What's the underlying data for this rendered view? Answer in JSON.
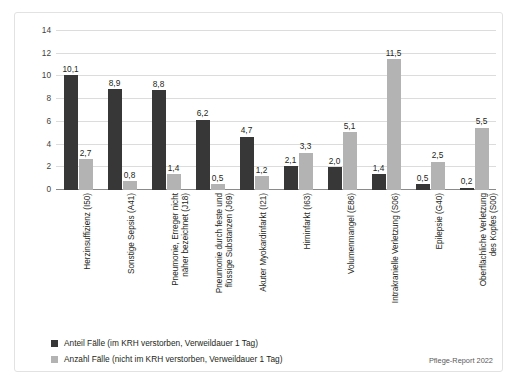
{
  "chart_data": {
    "type": "bar",
    "title": "",
    "xlabel": "",
    "ylabel": "",
    "ylim": [
      0,
      14
    ],
    "yticks": [
      0,
      2,
      4,
      6,
      8,
      10,
      12,
      14
    ],
    "grid": true,
    "legend_position": "bottom-left",
    "categories": [
      "Herzinsuffizienz (I50)",
      "Sonstige Sepsis (A41)",
      "Pneumonie, Erreger nicht\nnäher bezeichnet (J18)",
      "Pneumonie durch feste und\nflüssige Substanzen (J69)",
      "Akuter Myokardinfarkt (I21)",
      "Hirninfarkt (I63)",
      "Volumenmangel (E86)",
      "Intrakranielle Verletzung (S06)",
      "Epilepsie (G40)",
      "Oberflächliche Verletzung\ndes Kopfes (S00)"
    ],
    "series": [
      {
        "name": "Anteil Fälle (im KRH verstorben, Verweildauer 1 Tag)",
        "color": "#373737",
        "values": [
          10.1,
          8.9,
          8.8,
          6.2,
          4.7,
          2.1,
          2.0,
          1.4,
          0.5,
          0.2
        ],
        "labels": [
          "10,1",
          "8,9",
          "8,8",
          "6,2",
          "4,7",
          "2,1",
          "2,0",
          "1,4",
          "0,5",
          "0,2"
        ]
      },
      {
        "name": "Anzahl Fälle (nicht im KRH verstorben, Verweildauer 1 Tag)",
        "color": "#b3b3b3",
        "values": [
          2.7,
          0.8,
          1.4,
          0.5,
          1.2,
          3.3,
          5.1,
          11.5,
          2.5,
          5.5
        ],
        "labels": [
          "2,7",
          "0,8",
          "1,4",
          "0,5",
          "1,2",
          "3,3",
          "5,1",
          "11,5",
          "2,5",
          "5,5"
        ]
      }
    ],
    "source_note": "Pflege-Report 2022"
  }
}
